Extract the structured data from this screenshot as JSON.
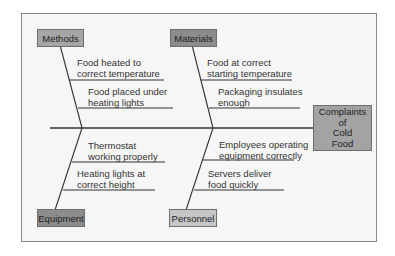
{
  "diagram": {
    "type": "fishbone",
    "effect": {
      "lines": [
        "Complaints",
        "of",
        "Cold",
        "Food"
      ],
      "color": "#a3a3a3"
    },
    "categories": [
      {
        "id": "methods",
        "label": "Methods",
        "color": "#a6a6a6",
        "position": "top-left",
        "causes": [
          {
            "line1": "Food heated to",
            "line2": "correct temperature"
          },
          {
            "line1": "Food placed under",
            "line2": "heating lights"
          }
        ]
      },
      {
        "id": "materials",
        "label": "Materials",
        "color": "#8c8c8c",
        "position": "top-right",
        "causes": [
          {
            "line1": "Food at correct",
            "line2": "starting temperature"
          },
          {
            "line1": "Packaging insulates",
            "line2": "enough"
          }
        ]
      },
      {
        "id": "equipment",
        "label": "Equipment",
        "color": "#8c8c8c",
        "position": "bottom-left",
        "causes": [
          {
            "line1": "Thermostat",
            "line2": "working properly"
          },
          {
            "line1": "Heating lights at",
            "line2": "correct height"
          }
        ]
      },
      {
        "id": "personnel",
        "label": "Personnel",
        "color": "#c6c6c6",
        "position": "bottom-right",
        "causes": [
          {
            "line1": "Employees operating",
            "line2": "equipment correctly"
          },
          {
            "line1": "Servers deliver",
            "line2": "food quickly"
          }
        ]
      }
    ],
    "colors": {
      "frame_bg": "#f6f6f6",
      "frame_border": "#8a8a8a",
      "line": "#333333"
    }
  }
}
